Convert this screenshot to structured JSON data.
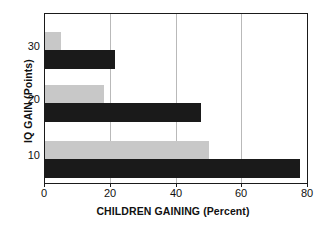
{
  "chart_data": {
    "type": "bar",
    "orientation": "horizontal",
    "title": "",
    "xlabel": "CHILDREN GAINING (Percent)",
    "ylabel": "IQ GAIN (Points)",
    "categories": [
      "10",
      "20",
      "30"
    ],
    "xlim": [
      0,
      80
    ],
    "xticks": [
      "0",
      "20",
      "40",
      "60",
      "80"
    ],
    "yticks": [
      "10",
      "20",
      "30"
    ],
    "grid": "vertical",
    "legend": "none",
    "series": [
      {
        "name": "dark",
        "color": "#1a1a1a",
        "values": [
          78,
          47.5,
          21.5
        ]
      },
      {
        "name": "light",
        "color": "#c8c8c8",
        "values": [
          50,
          18,
          5
        ]
      }
    ]
  },
  "axes": {
    "x_title": "CHILDREN GAINING (Percent)",
    "y_title": "IQ GAIN (Points)",
    "x_ticks": [
      {
        "label": "0",
        "value": 0
      },
      {
        "label": "20",
        "value": 20
      },
      {
        "label": "40",
        "value": 40
      },
      {
        "label": "60",
        "value": 60
      },
      {
        "label": "80",
        "value": 80
      }
    ],
    "y_ticks": [
      {
        "label": "30",
        "value": 30
      },
      {
        "label": "20",
        "value": 20
      },
      {
        "label": "10",
        "value": 10
      }
    ]
  },
  "colors": {
    "dark_series": "#1a1a1a",
    "light_series": "#c8c8c8",
    "gridline": "#b9b9b9",
    "axis": "#1a1a1a",
    "background": "#ffffff",
    "text": "#111111"
  }
}
